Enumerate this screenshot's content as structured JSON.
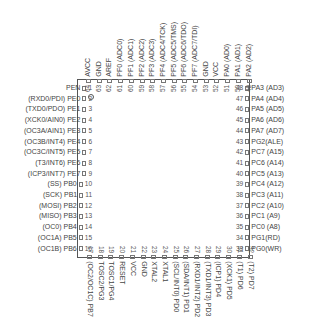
{
  "chip": {
    "package": "TQFP-64",
    "pin1_marker": "circle"
  },
  "pins": {
    "left": [
      {
        "num": "1",
        "label": "PEN"
      },
      {
        "num": "2",
        "label": "(RXD0/PDI) PE0"
      },
      {
        "num": "3",
        "label": "(TXD0/PDO) PE1"
      },
      {
        "num": "4",
        "label": "(XCK0/AIN0) PE2"
      },
      {
        "num": "5",
        "label": "(OC3A/AIN1) PE3"
      },
      {
        "num": "6",
        "label": "(OC3B/INT4) PE4"
      },
      {
        "num": "7",
        "label": "(OC3C/INT5) PE5"
      },
      {
        "num": "8",
        "label": "(T3/INT6) PE6"
      },
      {
        "num": "9",
        "label": "(ICP3/INT7) PE7"
      },
      {
        "num": "10",
        "label": "(SS) PB0"
      },
      {
        "num": "11",
        "label": "(SCK) PB1"
      },
      {
        "num": "12",
        "label": "(MOSI) PB2"
      },
      {
        "num": "13",
        "label": "(MISO) PB3"
      },
      {
        "num": "14",
        "label": "(OC0) PB4"
      },
      {
        "num": "15",
        "label": "(OC1A) PB5"
      },
      {
        "num": "16",
        "label": "(OC1B) PB6"
      }
    ],
    "bottom": [
      {
        "num": "17",
        "label": "(OC2/OC1C) PB7"
      },
      {
        "num": "18",
        "label": "TOSC2/PG3"
      },
      {
        "num": "19",
        "label": "TOSC1/PG4"
      },
      {
        "num": "20",
        "label": "RESET"
      },
      {
        "num": "21",
        "label": "VCC"
      },
      {
        "num": "22",
        "label": "GND"
      },
      {
        "num": "23",
        "label": "XTAL2"
      },
      {
        "num": "24",
        "label": "XTAL1"
      },
      {
        "num": "25",
        "label": "(SCL/INT0) PD0"
      },
      {
        "num": "26",
        "label": "(SDA/INT1) PD1"
      },
      {
        "num": "27",
        "label": "(RXD1/INT2) PD2"
      },
      {
        "num": "28",
        "label": "(TXD1/INT3) PD3"
      },
      {
        "num": "29",
        "label": "(ICP1) PD4"
      },
      {
        "num": "30",
        "label": "(XCK1) PD5"
      },
      {
        "num": "31",
        "label": "(T1) PD6"
      },
      {
        "num": "32",
        "label": "(T2) PD7"
      }
    ],
    "right": [
      {
        "num": "48",
        "label": "PA3 (AD3)"
      },
      {
        "num": "47",
        "label": "PA4 (AD4)"
      },
      {
        "num": "46",
        "label": "PA5 (AD5)"
      },
      {
        "num": "45",
        "label": "PA6 (AD6)"
      },
      {
        "num": "44",
        "label": "PA7 (AD7)"
      },
      {
        "num": "43",
        "label": "PG2(ALE)"
      },
      {
        "num": "42",
        "label": "PC7 (A15)"
      },
      {
        "num": "41",
        "label": "PC6 (A14)"
      },
      {
        "num": "40",
        "label": "PC5 (A13)"
      },
      {
        "num": "39",
        "label": "PC4 (A12)"
      },
      {
        "num": "38",
        "label": "PC3 (A11)"
      },
      {
        "num": "37",
        "label": "PC2 (A10)"
      },
      {
        "num": "36",
        "label": "PC1 (A9)"
      },
      {
        "num": "35",
        "label": "PC0 (A8)"
      },
      {
        "num": "34",
        "label": "PG1(RD)"
      },
      {
        "num": "33",
        "label": "PG0(WR)"
      }
    ],
    "top": [
      {
        "num": "64",
        "label": "AVCC"
      },
      {
        "num": "63",
        "label": "GND"
      },
      {
        "num": "62",
        "label": "AREF"
      },
      {
        "num": "61",
        "label": "PF0 (ADC0)"
      },
      {
        "num": "60",
        "label": "PF1 (ADC1)"
      },
      {
        "num": "59",
        "label": "PF2 (ADC2)"
      },
      {
        "num": "58",
        "label": "PF3 (ADC3)"
      },
      {
        "num": "57",
        "label": "PF4 (ADC4/TCK)"
      },
      {
        "num": "56",
        "label": "PF5 (ADC5/TMS)"
      },
      {
        "num": "55",
        "label": "PF6 (ADC6/TDO)"
      },
      {
        "num": "54",
        "label": "PF7 (ADC7/TDI)"
      },
      {
        "num": "53",
        "label": "GND"
      },
      {
        "num": "52",
        "label": "VCC"
      },
      {
        "num": "51",
        "label": "PA0 (AD0)"
      },
      {
        "num": "50",
        "label": "PA1 (AD1)"
      },
      {
        "num": "49",
        "label": "PA2 (AD2)"
      }
    ]
  }
}
